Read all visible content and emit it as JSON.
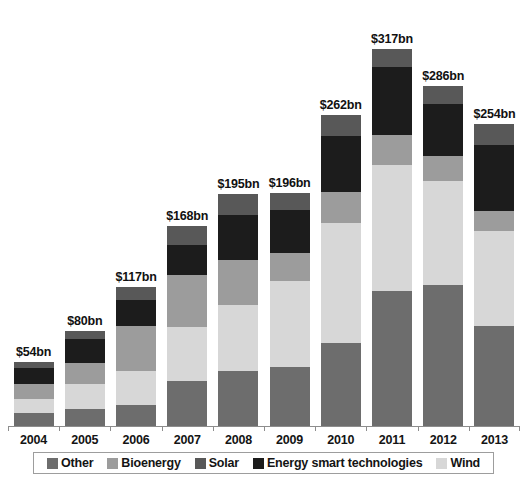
{
  "chart_data": {
    "type": "bar",
    "variant": "stacked",
    "title": "",
    "subtitle": "",
    "xlabel": "",
    "ylabel": "",
    "unit": "$bn",
    "grid": false,
    "legend_position": "bottom",
    "ylim": [
      0,
      330
    ],
    "categories": [
      "2004",
      "2005",
      "2006",
      "2007",
      "2008",
      "2009",
      "2010",
      "2011",
      "2012",
      "2013"
    ],
    "series": [
      {
        "name": "Other",
        "color": "#6d6d6d",
        "values": [
          11,
          14,
          18,
          38,
          46,
          50,
          70,
          114,
          119,
          84
        ]
      },
      {
        "name": "Wind",
        "color": "#d7d7d7",
        "values": [
          12,
          21,
          28,
          45,
          56,
          72,
          101,
          106,
          87,
          80
        ]
      },
      {
        "name": "Bioenergy",
        "color": "#9c9c9c",
        "values": [
          12,
          18,
          38,
          44,
          38,
          24,
          26,
          25,
          21,
          17
        ]
      },
      {
        "name": "Energy smart technologies",
        "color": "#1c1c1c",
        "values": [
          14,
          20,
          22,
          25,
          38,
          36,
          47,
          57,
          44,
          56
        ]
      },
      {
        "name": "Solar",
        "color": "#585858",
        "values": [
          5,
          7,
          11,
          16,
          17,
          14,
          18,
          15,
          15,
          17
        ]
      }
    ],
    "totals": [
      54,
      80,
      117,
      168,
      195,
      196,
      262,
      317,
      286,
      254
    ],
    "total_labels": [
      "$54bn",
      "$80bn",
      "$117bn",
      "$168bn",
      "$195bn",
      "$196bn",
      "$262bn",
      "$317bn",
      "$286bn",
      "$254bn"
    ]
  },
  "legend": {
    "items": [
      {
        "label": "Other",
        "color": "#6d6d6d"
      },
      {
        "label": "Bioenergy",
        "color": "#9c9c9c"
      },
      {
        "label": "Solar",
        "color": "#585858"
      },
      {
        "label": "Energy smart technologies",
        "color": "#1c1c1c"
      },
      {
        "label": "Wind",
        "color": "#d7d7d7"
      }
    ]
  },
  "axis": {
    "line_color": "#8d8d8d"
  }
}
